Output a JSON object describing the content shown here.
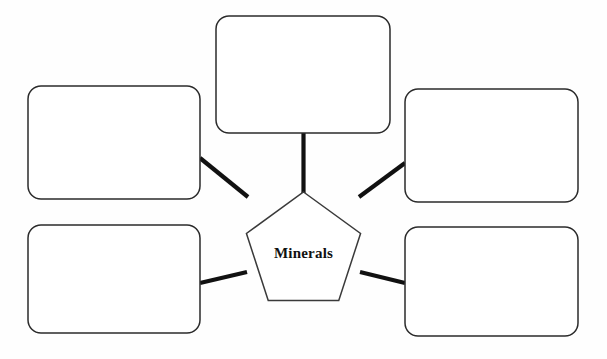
{
  "diagram": {
    "type": "concept-map",
    "title": "",
    "center": {
      "label": "Minerals",
      "shape": "pentagon",
      "cx": 303.5,
      "cy": 252,
      "radius": 60,
      "fill": "#ffffff",
      "stroke": "#3a3a3a"
    },
    "style": {
      "background": "#fefefe",
      "connector_color": "#111111",
      "connector_width": 4.2,
      "box_stroke": "#2b2b2b",
      "box_fill": "#ffffff",
      "box_stroke_width": 1.5,
      "box_corner_radius": 13
    },
    "nodes": [
      {
        "id": "node-top",
        "label": "",
        "x": 216,
        "y": 16,
        "width": 174,
        "height": 117
      },
      {
        "id": "node-upper-left",
        "label": "",
        "x": 28,
        "y": 86,
        "width": 172,
        "height": 113
      },
      {
        "id": "node-upper-right",
        "label": "",
        "x": 405,
        "y": 89,
        "width": 173,
        "height": 113
      },
      {
        "id": "node-lower-left",
        "label": "",
        "x": 28,
        "y": 225,
        "width": 172,
        "height": 108
      },
      {
        "id": "node-lower-right",
        "label": "",
        "x": 405,
        "y": 227,
        "width": 173,
        "height": 109
      }
    ],
    "connectors": [
      {
        "id": "connector-top",
        "x1": 303.5,
        "y1": 133,
        "x2": 303.5,
        "y2": 193
      },
      {
        "id": "connector-upper-left",
        "x1": 200,
        "y1": 158,
        "x2": 248,
        "y2": 197
      },
      {
        "id": "connector-upper-right",
        "x1": 405,
        "y1": 163,
        "x2": 359,
        "y2": 197
      },
      {
        "id": "connector-lower-left",
        "x1": 200,
        "y1": 283,
        "x2": 247,
        "y2": 272
      },
      {
        "id": "connector-lower-right",
        "x1": 405,
        "y1": 283,
        "x2": 360,
        "y2": 272
      }
    ]
  }
}
